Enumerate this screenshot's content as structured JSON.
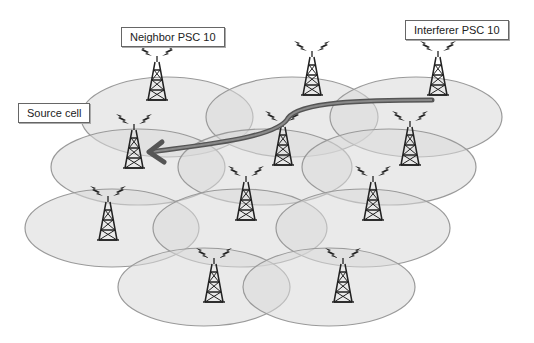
{
  "labels": {
    "neighbor": "Neighbor PSC 10",
    "interferer": "Interferer PSC 10",
    "source": "Source cell"
  },
  "colors": {
    "cell_fill": "#d8d8d8",
    "cell_stroke": "#9a9a9a",
    "tower": "#222222",
    "arrow_outer": "#555555",
    "arrow_inner": "#8a8a8a"
  },
  "cells": [
    {
      "cx": 167,
      "cy": 117,
      "rx": 86,
      "ry": 40
    },
    {
      "cx": 292,
      "cy": 117,
      "rx": 86,
      "ry": 40
    },
    {
      "cx": 416,
      "cy": 117,
      "rx": 86,
      "ry": 40
    },
    {
      "cx": 138,
      "cy": 167,
      "rx": 87,
      "ry": 38
    },
    {
      "cx": 265,
      "cy": 167,
      "rx": 87,
      "ry": 38
    },
    {
      "cx": 389,
      "cy": 167,
      "rx": 87,
      "ry": 38
    },
    {
      "cx": 112,
      "cy": 228,
      "rx": 87,
      "ry": 39
    },
    {
      "cx": 240,
      "cy": 228,
      "rx": 87,
      "ry": 39
    },
    {
      "cx": 363,
      "cy": 228,
      "rx": 87,
      "ry": 39
    },
    {
      "cx": 204,
      "cy": 287,
      "rx": 86,
      "ry": 39
    },
    {
      "cx": 329,
      "cy": 287,
      "rx": 86,
      "ry": 39
    }
  ],
  "towers": [
    {
      "x": 157,
      "y": 60,
      "role": "neighbor"
    },
    {
      "x": 312,
      "y": 55,
      "role": "cell"
    },
    {
      "x": 438,
      "y": 55,
      "role": "interferer"
    },
    {
      "x": 134,
      "y": 128,
      "role": "source"
    },
    {
      "x": 283,
      "y": 125,
      "role": "cell"
    },
    {
      "x": 410,
      "y": 125,
      "role": "cell"
    },
    {
      "x": 246,
      "y": 180,
      "role": "cell"
    },
    {
      "x": 373,
      "y": 180,
      "role": "cell"
    },
    {
      "x": 108,
      "y": 200,
      "role": "cell"
    },
    {
      "x": 214,
      "y": 262,
      "role": "cell"
    },
    {
      "x": 343,
      "y": 262,
      "role": "cell"
    }
  ],
  "arrow": {
    "from": "interferer",
    "to": "source",
    "path": "M 432 100 C 360 100, 300 102, 288 118 C 278 138, 200 145, 150 152"
  }
}
